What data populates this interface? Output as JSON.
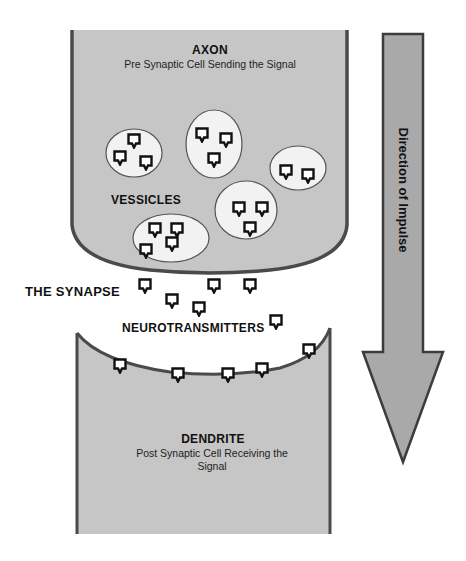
{
  "axon": {
    "title": "AXON",
    "subtitle": "Pre Synaptic Cell Sending the Signal",
    "vesicles_label": "VESSICLES"
  },
  "synapse": {
    "label": "THE SYNAPSE",
    "neurotransmitters_label": "NEUROTRANSMITTERS"
  },
  "dendrite": {
    "title": "DENDRITE",
    "subtitle_line1": "Post Synaptic Cell Receiving the",
    "subtitle_line2": "Signal"
  },
  "arrow": {
    "label": "Direction of Impulse"
  },
  "colors": {
    "cell_fill": "#c6c6c6",
    "cell_border": "#4a4a4a",
    "vesicle_fill": "#f2f2f2",
    "arrow_fill": "#a9a9a9",
    "arrow_border": "#3c3c3c"
  },
  "vesicles": [
    {
      "cx": 134,
      "cy": 153,
      "rx": 28,
      "ry": 24,
      "transmitters": [
        [
          134,
          140
        ],
        [
          120,
          157
        ],
        [
          146,
          162
        ]
      ]
    },
    {
      "cx": 214,
      "cy": 144,
      "rx": 28,
      "ry": 34,
      "transmitters": [
        [
          202,
          134
        ],
        [
          226,
          139
        ],
        [
          214,
          159
        ]
      ]
    },
    {
      "cx": 298,
      "cy": 168,
      "rx": 28,
      "ry": 22,
      "transmitters": [
        [
          286,
          171
        ],
        [
          308,
          175
        ]
      ]
    },
    {
      "cx": 246,
      "cy": 210,
      "rx": 31,
      "ry": 29,
      "transmitters": [
        [
          239,
          208
        ],
        [
          262,
          208
        ],
        [
          250,
          228
        ]
      ]
    },
    {
      "cx": 171,
      "cy": 238,
      "rx": 38,
      "ry": 24,
      "transmitters": [
        [
          155,
          229
        ],
        [
          177,
          229
        ],
        [
          172,
          243
        ],
        [
          146,
          250
        ]
      ]
    }
  ],
  "free_transmitters": [
    [
      145,
      285
    ],
    [
      172,
      300
    ],
    [
      199,
      308
    ],
    [
      214,
      285
    ],
    [
      250,
      285
    ],
    [
      276,
      321
    ]
  ],
  "receptor_transmitters": [
    [
      120,
      365
    ],
    [
      178,
      374
    ],
    [
      228,
      374
    ],
    [
      262,
      369
    ],
    [
      309,
      350
    ]
  ]
}
